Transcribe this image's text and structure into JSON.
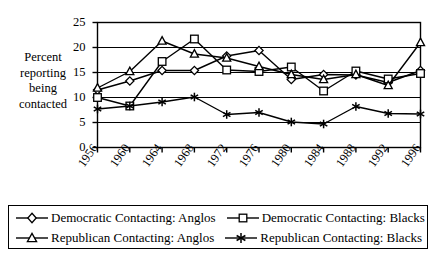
{
  "chart_data": {
    "type": "line",
    "title": "",
    "xlabel": "",
    "ylabel": "Percent reporting being contacted",
    "ylabel_lines": [
      "Percent",
      "reporting",
      "being",
      "contacted"
    ],
    "categories": [
      "1956",
      "1960",
      "1964",
      "1968",
      "1972",
      "1976",
      "1980",
      "1984",
      "1988",
      "1992",
      "1996"
    ],
    "x": [
      1956,
      1960,
      1964,
      1968,
      1972,
      1976,
      1980,
      1984,
      1988,
      1992,
      1996
    ],
    "xlim": [
      1956,
      1996
    ],
    "ylim": [
      0,
      25
    ],
    "yticks": [
      0,
      5,
      10,
      15,
      20,
      25
    ],
    "ytick_labels": [
      "0",
      "5",
      "10",
      "15",
      "20",
      "25"
    ],
    "grid": true,
    "grid_axis": "y",
    "legend_position": "bottom",
    "series": [
      {
        "name": "Democratic Contacting: Anglos",
        "marker": "diamond",
        "values": [
          11.5,
          13.3,
          15.4,
          15.4,
          18.3,
          19.4,
          13.6,
          14.6,
          14.5,
          13.0,
          15.4
        ]
      },
      {
        "name": "Democratic Contacting: Blacks",
        "marker": "square",
        "values": [
          10.0,
          8.3,
          17.2,
          21.7,
          15.5,
          15.2,
          16.1,
          11.3,
          15.3,
          13.7,
          14.8
        ]
      },
      {
        "name": "Republican Contacting: Anglos",
        "marker": "triangle",
        "values": [
          11.9,
          15.2,
          21.3,
          18.7,
          17.9,
          16.2,
          14.6,
          13.6,
          14.6,
          12.4,
          21.0
        ]
      },
      {
        "name": "Republican Contacting: Blacks",
        "marker": "asterisk",
        "values": [
          7.7,
          8.3,
          9.1,
          10.1,
          6.6,
          7.0,
          5.1,
          4.7,
          8.2,
          6.8,
          6.7
        ]
      }
    ]
  },
  "legend": {
    "items": [
      {
        "label": "Democratic Contacting: Anglos",
        "marker": "diamond"
      },
      {
        "label": "Democratic Contacting: Blacks",
        "marker": "square"
      },
      {
        "label": "Republican Contacting: Anglos",
        "marker": "triangle"
      },
      {
        "label": "Republican Contacting: Blacks",
        "marker": "asterisk"
      }
    ]
  },
  "colors": {
    "line": "#000000",
    "axis": "#000000",
    "grid": "#000000",
    "background": "#ffffff"
  }
}
